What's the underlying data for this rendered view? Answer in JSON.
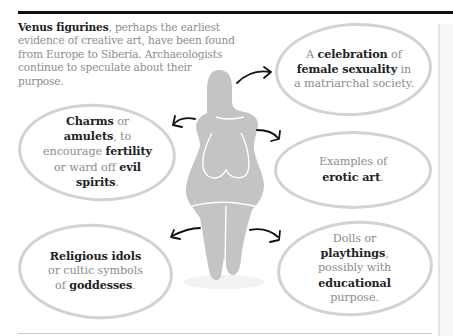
{
  "intro": {
    "bold": "Venus figurines",
    "rest": ", perhaps the earliest evidence of creative art, have been found from Europe to Siberia. Archaeologists continue to speculate about their purpose."
  },
  "theories": [
    {
      "id": "celebration",
      "parts": [
        {
          "t": "A ",
          "b": false
        },
        {
          "t": "celebration",
          "b": true
        },
        {
          "t": " of ",
          "b": false
        },
        {
          "t": "female sexuality",
          "b": true
        },
        {
          "t": " in a matriarchal society.",
          "b": false
        }
      ],
      "lines": [
        "A celebration of",
        "female sexuality in",
        "a matriarchal society."
      ]
    },
    {
      "id": "charms",
      "lines": [
        "Charms or",
        "amulets, to",
        "encourage fertility",
        "or ward off evil",
        "spirits."
      ]
    },
    {
      "id": "erotic-art",
      "lines": [
        "Examples of",
        "erotic art."
      ]
    },
    {
      "id": "religious-idols",
      "lines": [
        "Religious idols",
        "or cultic symbols",
        "of goddesses."
      ]
    },
    {
      "id": "dolls",
      "lines": [
        "Dolls or",
        "playthings,",
        "possibly with",
        "educational",
        "purpose."
      ]
    }
  ],
  "text": {
    "b1_l1_a": "A ",
    "b1_l1_b": "celebration",
    "b1_l1_c": " of",
    "b1_l2_a": "female sexuality",
    "b1_l2_b": " in",
    "b1_l3": "a matriarchal society.",
    "b2_l1_a": "Charms",
    "b2_l1_b": " or",
    "b2_l2_a": "amulets",
    "b2_l2_b": ", to",
    "b2_l3_a": "encourage ",
    "b2_l3_b": "fertility",
    "b2_l4_a": "or ward off ",
    "b2_l4_b": "evil",
    "b2_l5_a": "spirits",
    "b2_l5_b": ".",
    "b3_l1": "Examples of",
    "b3_l2_a": "erotic art",
    "b3_l2_b": ".",
    "b4_l1": "Religious idols",
    "b4_l2": "or cultic symbols",
    "b4_l3_a": "of ",
    "b4_l3_b": "goddesses",
    "b4_l3_c": ".",
    "b5_l1": "Dolls or",
    "b5_l2_a": "playthings",
    "b5_l2_b": ",",
    "b5_l3": "possibly with",
    "b5_l4": "educational",
    "b5_l5": "purpose."
  },
  "colors": {
    "figure": "#c4c4c4",
    "bubble_border": "#d2d2d2",
    "bold_text": "#222222",
    "body_text": "#8d8d8d",
    "arrow": "#111111",
    "rule": "#111111"
  }
}
